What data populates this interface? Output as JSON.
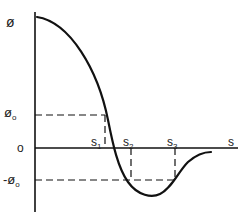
{
  "diagram": {
    "y_label": "ø",
    "x_label": "s",
    "origin_label": "o",
    "levels": [
      {
        "id": "phi0",
        "label": "ø",
        "sub": "o",
        "prefix": ""
      },
      {
        "id": "neg_phi0",
        "label": "ø",
        "sub": "o",
        "prefix": "-"
      }
    ],
    "s_points": [
      {
        "id": "s1",
        "label": "s",
        "sub": "1"
      },
      {
        "id": "s2",
        "label": "s",
        "sub": "2"
      },
      {
        "id": "s3",
        "label": "s",
        "sub": "3"
      }
    ],
    "stroke_color": "#111111"
  }
}
